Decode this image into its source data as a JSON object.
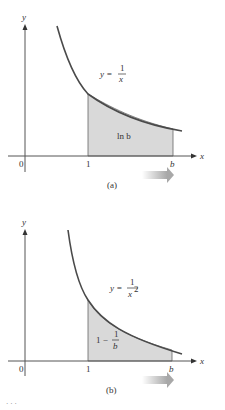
{
  "figure": {
    "panels": [
      {
        "id": "a",
        "label": "(a)",
        "axis_y": "y",
        "axis_x": "x",
        "origin": "0",
        "tick_1": "1",
        "tick_b": "b",
        "function_lhs": "y =",
        "function_num": "1",
        "function_den": "x",
        "area_label": "ln b"
      },
      {
        "id": "b",
        "label": "(b)",
        "axis_y": "y",
        "axis_x": "x",
        "origin": "0",
        "tick_1": "1",
        "tick_b": "b",
        "function_lhs": "y =",
        "function_num": "1",
        "function_den": "x",
        "function_den_exp": "2",
        "area_label_prefix": "1 −",
        "area_num": "1",
        "area_den": "b"
      }
    ],
    "colors": {
      "curve": "#4a4a4a",
      "shaded_region": "#d9d9d9",
      "arrow": "#bdbdbd"
    },
    "caption_partial": "· · ·"
  }
}
